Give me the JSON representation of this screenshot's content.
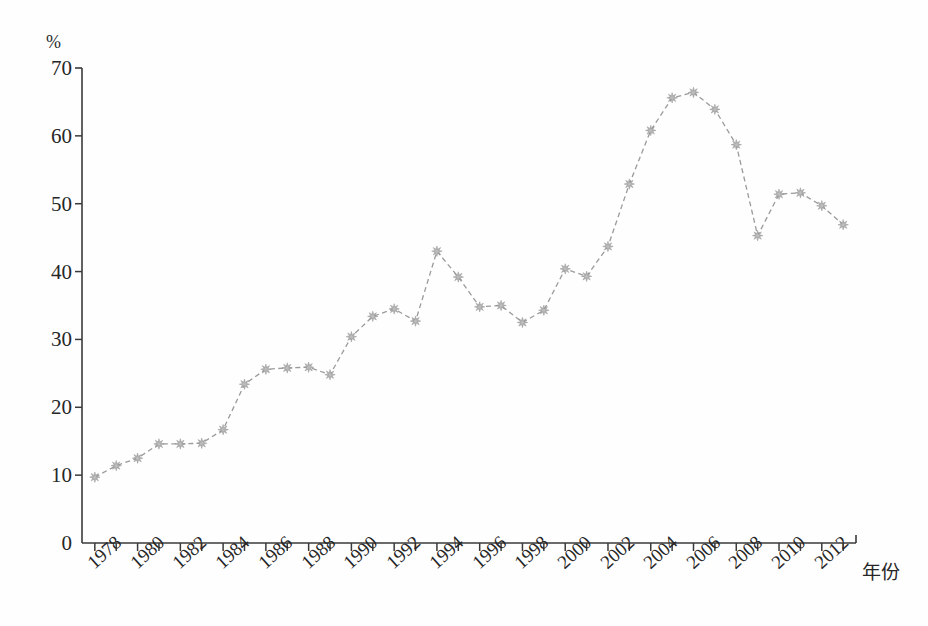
{
  "figure": {
    "background_color": "#fefefe",
    "line_color": "#9a9a9a",
    "marker_color": "#a8a8a8",
    "axis_color": "#3a3a3a",
    "text_color": "#262626"
  },
  "axes": {
    "y_unit_label": "%",
    "y_ticks": [
      0,
      10,
      20,
      30,
      40,
      50,
      60,
      70
    ],
    "x_title": "年份",
    "x_tick_labels": [
      "1978",
      "1980",
      "1982",
      "1984",
      "1986",
      "1988",
      "1990",
      "1992",
      "1994",
      "1996",
      "1998",
      "2000",
      "2002",
      "2004",
      "2006",
      "2008",
      "2010",
      "2012"
    ]
  },
  "chart_data": {
    "type": "line",
    "title": "",
    "subtitle": "",
    "xlabel": "年份",
    "ylabel": "%",
    "xlim": [
      1977.5,
      1913.5
    ],
    "ylim": [
      0,
      70
    ],
    "grid": false,
    "legend_position": "none",
    "marker": "star-diamond",
    "line_style": "dashed",
    "x": [
      1978,
      1979,
      1980,
      1981,
      1982,
      1983,
      1984,
      1985,
      1986,
      1987,
      1988,
      1989,
      1990,
      1991,
      1992,
      1993,
      1994,
      1995,
      1996,
      1997,
      1998,
      1999,
      2000,
      2001,
      2002,
      2003,
      2004,
      2005,
      2006,
      2007,
      2008,
      2009,
      2010,
      2011,
      2012,
      2013
    ],
    "values": [
      9.7,
      11.4,
      12.5,
      14.6,
      14.6,
      14.7,
      16.7,
      23.4,
      25.6,
      25.8,
      25.9,
      24.8,
      30.4,
      33.4,
      34.5,
      32.7,
      43.0,
      39.2,
      34.8,
      35.0,
      32.5,
      34.3,
      40.4,
      39.3,
      43.7,
      52.9,
      60.8,
      65.6,
      66.4,
      63.9,
      58.7,
      45.3,
      51.4,
      51.6,
      49.7,
      46.9
    ],
    "annotations": []
  },
  "geometry": {
    "plot_left": 82,
    "plot_right": 856,
    "plot_top": 68,
    "plot_bottom": 543
  }
}
